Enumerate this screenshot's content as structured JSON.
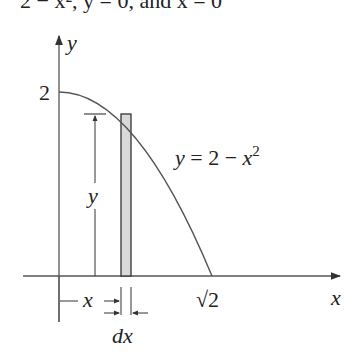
{
  "header": {
    "cropped_text": "2 − x², y = 0, and x = 0"
  },
  "diagram": {
    "axis_labels": {
      "x": "x",
      "y": "y"
    },
    "y_tick": "2",
    "x_tick": "√2",
    "curve_label": {
      "lhs": "y = 2 − x",
      "exponent": "2"
    },
    "strip_labels": {
      "height": "y",
      "position": "x",
      "width": "dx"
    },
    "colors": {
      "line": "#555555",
      "strip_fill": "#d9d9d9",
      "text": "#222222"
    }
  }
}
